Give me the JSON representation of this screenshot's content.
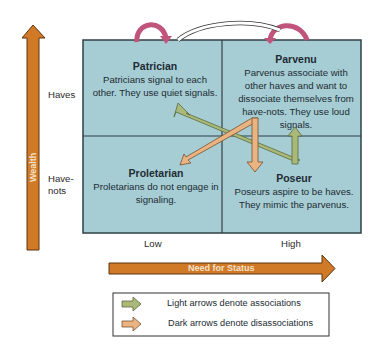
{
  "diagram": {
    "y_axis": {
      "label": "Wealth",
      "ticks": [
        "Haves",
        "Have-\nnots"
      ]
    },
    "x_axis": {
      "label": "Need for Status",
      "ticks": [
        "Low",
        "High"
      ]
    },
    "quadrants": [
      {
        "id": "patrician",
        "title": "Patrician",
        "text": "Patricians signal to each other. They use quiet signals."
      },
      {
        "id": "parvenu",
        "title": "Parvenu",
        "text": "Parvenus associate with other haves and want to dissociate themselves from have-nots. They use loud signals."
      },
      {
        "id": "proletarian",
        "title": "Proletarian",
        "text": "Proletarians do not engage in signaling."
      },
      {
        "id": "poseur",
        "title": "Poseur",
        "text": "Poseurs aspire to be haves. They mimic the parvenus."
      }
    ],
    "legend": [
      {
        "label": "Light arrows denote associations",
        "color": "#a9b97a"
      },
      {
        "label": "Dark arrows denote disassociations",
        "color": "#eab382"
      }
    ],
    "colors": {
      "box_fill": "#a6cdd3",
      "box_border": "#2f4047",
      "axis_arrow": "#d07a28",
      "light_arrow": "#a9b97a",
      "dark_arrow": "#eab382",
      "self_arrow": "#c0547a"
    }
  }
}
